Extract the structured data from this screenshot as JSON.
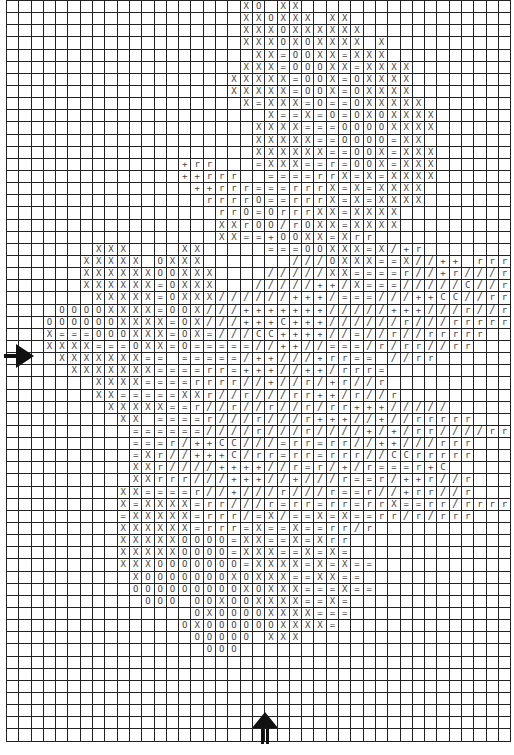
{
  "chart": {
    "columns": 41,
    "rows_count": 61,
    "legend_symbols": {
      ".": "empty",
      "X": "X",
      "O": "O",
      "=": "=",
      "/": "/",
      "+": "+",
      "r": "r",
      "C": "C"
    },
    "center_markers": {
      "left_arrow": "center-row-marker",
      "bottom_arrow": "center-column-marker"
    },
    "grid": [
      "...................XO.XX..................",
      "...................XXOXXX.XX.............",
      "...................XXXOXXXXXX............",
      "...................XXXOXOXXXX.X..........",
      "....................XX=OOXX=XXX..........",
      "...................XXX=OOOXX=XXXX........",
      "..................XXXXX=OOX=OXXXX........",
      "..................XXXXX=OOX=OXXXX........",
      "...................X=XXX=O==OXXXXX.......",
      ".....................X==X=O=OXOXXXX......",
      "....................XXXX===OOOOXXXX......",
      "....................XXXXX==OOOO=XX.......",
      "....................XXXXXX==OOX=XXX......",
      "..............+rr...=XXX==r=OOX=XXX......",
      "..............++rrr..====rrX=X=XXXX......",
      "...............++rrr===rrrX=X=XXXX.......",
      "................rrrrO==rrrX=X=XXXX.......",
      ".................rrO=OrrrXX=XXXX.........",
      ".................XXrOO!rOXX-XXXX.........",
      ".................XX==+OOXX=Xrr...........",
      ".......XXX....XX.....===OOXXX=X/+r.......",
      "......XXXXX.OXXX.......///OXXX==X//++.rrrr",
      "......XXXXXXOOXXX..../////XX====r//+r///rr",
      "......XXXXXX=OXXX.../////++/X===/////C//rrr",
      ".......XXXXX=OXXX//////+++/===///++CC//rrr.",
      "....OOOOXXXX=OOX///+++++++/////+++///r//r..",
      "...OOOOOOXXXX=OX///+++C+++//////r///rrrrr..",
      "...X===OOOXXX=OX=///CC++++//=//r//rrrrr....",
      "...XXXX===OXX=O=====//++//===/r/rr//rr.....",
      "....XXXXXXX==.=====/++///+rr==.//rr........",
      ".....XXXXXXX====rr=+++//++/rrr=............",
      ".......XXXX====rrrr//+//r/+r//r............",
      ".......XX=====XXr//r///rr++/r//r...........",
      "........XXXXX==r//r//r//r/rr+++/////.......",
      ".........XX.====r///r///r+++//+//rrrrr.....",
      "..........======////r///r////+/+/rr////rr..",
      "..........===r/++CC///=rr=rr//++///rrr.....",
      "..........=Xr//+++C/rr=rr=rrr//CCrrrrr.....",
      "..........XXr////++++//r=r/+/r===r+C.......",
      "..........XXrrr///+++//+///r==r/++r//r.....",
      ".........XX====r//+///r///r==r//+rr//r.....",
      ".........X=XXXX=rr///r=rr=rr=rrX==rr/rrrr..",
      ".........=XXXXX=rrr/=X/==X=X==rr/r/rrr.....",
      ".........XXXXXX=rrr=X==X==rr/r.............",
      ".........XXXXXOOOO=XX==X=Xrr...............",
      ".........XXXXXOOOO=XXX==X=X=...............",
      ".........XXXOOOOOOO=XXXX=X=X==.............",
      "..........XOOOOOOOXOXXX==XX==..............",
      "..........OOOOOOOOOXOXXX===X==.............",
      "...........OOO.OOXOOXXXX==X=...............",
      "...............OXOOOOXXXX===...............",
      "..............OXOOOOOOXXXX=................",
      "...............OOOOO.XXX...................",
      "................OOO........................",
      ".........................................",
      ".........................................",
      ".........................................",
      ".........................................",
      ".........................................",
      ".........................................",
      "........................................."
    ]
  }
}
